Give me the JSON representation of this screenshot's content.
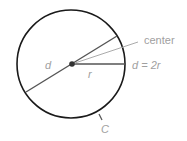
{
  "diagram": {
    "labels": {
      "diameter": "d",
      "radius": "r",
      "center": "center",
      "formula": "d = 2r",
      "circumference": "C"
    },
    "colors": {
      "outline": "#1a1a1a",
      "line_dark": "#555555",
      "line_light": "#aaaaaa",
      "label": "#a0a0a0"
    }
  }
}
